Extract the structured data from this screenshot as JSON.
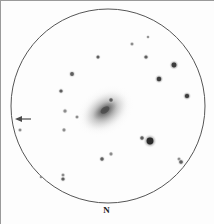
{
  "sketch": {
    "type": "astronomical-eyepiece-sketch",
    "background_color": "#fdfdfd",
    "frame": {
      "border_color": "#9a9a9a",
      "width": 214,
      "height": 224
    },
    "field_of_view_circle": {
      "center_x": 107,
      "center_y": 105,
      "radius": 97,
      "stroke_color": "#555555",
      "stroke_width": 1
    },
    "direction_markers": {
      "north_label": "N",
      "north_x": 107,
      "north_y": 210,
      "west_arrow": {
        "name": "west-direction-arrow",
        "tail_x": 30,
        "tip_x": 14,
        "y": 118,
        "color": "#4a4a4a"
      }
    },
    "galaxy": {
      "name": "central-galaxy",
      "center_x": 104,
      "center_y": 110,
      "major_axis": 54,
      "minor_axis": 36,
      "position_angle_deg": -35,
      "core_color": "#6e6e6e",
      "halo_color": "#c9c9c9"
    },
    "stars": [
      {
        "x": 147,
        "y": 36,
        "r": 1.1,
        "mag": "faint"
      },
      {
        "x": 131,
        "y": 43,
        "r": 1.3,
        "mag": "faint"
      },
      {
        "x": 97,
        "y": 56,
        "r": 1.5,
        "mag": "medium"
      },
      {
        "x": 145,
        "y": 56,
        "r": 1.6,
        "mag": "medium"
      },
      {
        "x": 173,
        "y": 64,
        "r": 2.4,
        "mag": "bright"
      },
      {
        "x": 71,
        "y": 73,
        "r": 1.9,
        "mag": "medium"
      },
      {
        "x": 158,
        "y": 78,
        "r": 2.2,
        "mag": "bright"
      },
      {
        "x": 60,
        "y": 90,
        "r": 1.6,
        "mag": "medium"
      },
      {
        "x": 186,
        "y": 95,
        "r": 2.1,
        "mag": "bright"
      },
      {
        "x": 110,
        "y": 99,
        "r": 1.7,
        "mag": "medium"
      },
      {
        "x": 64,
        "y": 110,
        "r": 1.5,
        "mag": "faint"
      },
      {
        "x": 76,
        "y": 116,
        "r": 1.3,
        "mag": "faint"
      },
      {
        "x": 19,
        "y": 129,
        "r": 1.3,
        "mag": "faint"
      },
      {
        "x": 63,
        "y": 129,
        "r": 1.4,
        "mag": "faint"
      },
      {
        "x": 141,
        "y": 137,
        "r": 1.7,
        "mag": "medium"
      },
      {
        "x": 149,
        "y": 140,
        "r": 3.4,
        "mag": "brightest"
      },
      {
        "x": 178,
        "y": 158,
        "r": 1.3,
        "mag": "faint"
      },
      {
        "x": 110,
        "y": 153,
        "r": 1.4,
        "mag": "faint"
      },
      {
        "x": 101,
        "y": 158,
        "r": 1.7,
        "mag": "medium"
      },
      {
        "x": 180,
        "y": 161,
        "r": 1.8,
        "mag": "medium"
      },
      {
        "x": 62,
        "y": 174,
        "r": 1.3,
        "mag": "faint"
      },
      {
        "x": 40,
        "y": 176,
        "r": 1.1,
        "mag": "faint"
      },
      {
        "x": 62,
        "y": 178,
        "r": 1.6,
        "mag": "medium"
      }
    ]
  }
}
